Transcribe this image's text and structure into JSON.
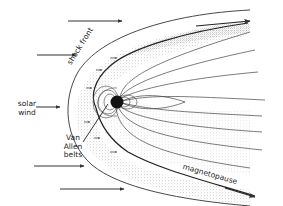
{
  "diagram": {
    "labels": {
      "shock_front": "shock front",
      "solar_wind_1": "solar",
      "solar_wind_2": "wind",
      "van_allen_1": "Van",
      "van_allen_2": "Allen",
      "van_allen_3": "belts",
      "magnetopause": "magnetopause"
    },
    "colors": {
      "line": "#333333",
      "stipple": "#9a9a9a",
      "earth": "#111111",
      "background": "#ffffff"
    }
  }
}
